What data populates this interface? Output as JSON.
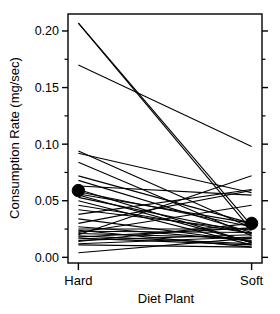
{
  "chart_data": {
    "type": "line",
    "title": "",
    "subtitle": "",
    "xlabel": "Diet Plant",
    "ylabel": "Consumption Rate  (mg/sec)",
    "categories": [
      "Hard",
      "Soft"
    ],
    "x": [
      0,
      1
    ],
    "xtick_labels": [
      "Hard",
      "Soft"
    ],
    "ytick_labels": [
      "0.00",
      "0.05",
      "0.10",
      "0.15",
      "0.20"
    ],
    "yticks": [
      0.0,
      0.05,
      0.1,
      0.15,
      0.2
    ],
    "ylim": [
      -0.005,
      0.215
    ],
    "xlim": [
      -0.06,
      1.06
    ],
    "grid": false,
    "legend": null,
    "legend_position": "none",
    "series_color": "#000000",
    "mean_marker_color": "#000000",
    "series": [
      {
        "name": "s01",
        "values": [
          0.207,
          0.028
        ]
      },
      {
        "name": "s02",
        "values": [
          0.207,
          0.024
        ]
      },
      {
        "name": "s03",
        "values": [
          0.17,
          0.098
        ]
      },
      {
        "name": "s04",
        "values": [
          0.094,
          0.026
        ]
      },
      {
        "name": "s05",
        "values": [
          0.092,
          0.057
        ]
      },
      {
        "name": "s06",
        "values": [
          0.084,
          0.019
        ]
      },
      {
        "name": "s07",
        "values": [
          0.072,
          0.03
        ]
      },
      {
        "name": "s08",
        "values": [
          0.068,
          0.022
        ]
      },
      {
        "name": "s09",
        "values": [
          0.063,
          0.055
        ]
      },
      {
        "name": "s10",
        "values": [
          0.06,
          0.013
        ]
      },
      {
        "name": "s11",
        "values": [
          0.058,
          0.027
        ]
      },
      {
        "name": "s12",
        "values": [
          0.056,
          0.03
        ]
      },
      {
        "name": "s13",
        "values": [
          0.055,
          0.013
        ]
      },
      {
        "name": "s14",
        "values": [
          0.053,
          0.021
        ]
      },
      {
        "name": "s15",
        "values": [
          0.05,
          0.011
        ]
      },
      {
        "name": "s16",
        "values": [
          0.046,
          0.021
        ]
      },
      {
        "name": "s17",
        "values": [
          0.042,
          0.024
        ]
      },
      {
        "name": "s18",
        "values": [
          0.038,
          0.06
        ]
      },
      {
        "name": "s19",
        "values": [
          0.034,
          0.014
        ]
      },
      {
        "name": "s20",
        "values": [
          0.03,
          0.059
        ]
      },
      {
        "name": "s21",
        "values": [
          0.027,
          0.015
        ]
      },
      {
        "name": "s22",
        "values": [
          0.025,
          0.025
        ]
      },
      {
        "name": "s23",
        "values": [
          0.024,
          0.009
        ]
      },
      {
        "name": "s24",
        "values": [
          0.023,
          0.022
        ]
      },
      {
        "name": "s25",
        "values": [
          0.022,
          0.046
        ]
      },
      {
        "name": "s26",
        "values": [
          0.021,
          0.017
        ]
      },
      {
        "name": "s27",
        "values": [
          0.02,
          0.072
        ]
      },
      {
        "name": "s28",
        "values": [
          0.019,
          0.012
        ]
      },
      {
        "name": "s29",
        "values": [
          0.018,
          0.026
        ]
      },
      {
        "name": "s30",
        "values": [
          0.017,
          0.011
        ]
      },
      {
        "name": "s31",
        "values": [
          0.015,
          0.02
        ]
      },
      {
        "name": "s32",
        "values": [
          0.014,
          0.03
        ]
      },
      {
        "name": "s33",
        "values": [
          0.012,
          0.018
        ]
      },
      {
        "name": "s34",
        "values": [
          0.011,
          0.009
        ]
      },
      {
        "name": "s35",
        "values": [
          0.004,
          0.017
        ]
      }
    ],
    "means": {
      "label": "group-mean",
      "values": [
        0.059,
        0.03
      ]
    }
  }
}
